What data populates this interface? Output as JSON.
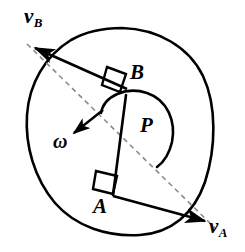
{
  "figure": {
    "type": "physics-diagram",
    "width": 245,
    "height": 252,
    "background_color": "#ffffff",
    "stroke_color": "#000000",
    "dashed_color": "#8a8a8a"
  },
  "labels": {
    "velocity_b": {
      "symbol": "v",
      "subscript": "B"
    },
    "velocity_a": {
      "symbol": "v",
      "subscript": "A"
    },
    "point_b": "B",
    "point_a": "A",
    "point_p": "P",
    "omega": "ω"
  },
  "geometry": {
    "body_outline": {
      "name": "rigid-body-outline",
      "path": "M 122,28 C 158,29 189,47 203,76 C 217,106 216,148 205,182 C 194,214 171,233 140,235 C 108,237 76,227 55,203 C 34,178 25,145 27,115 C 29,84 45,56 71,40 C 87,31 104,28 122,28 Z"
    },
    "segment_ab": {
      "name": "segment-AB",
      "from": [
        113,
        195
      ],
      "to": [
        126,
        95
      ]
    },
    "velocity_b_arrow": {
      "name": "velocity-b-arrow",
      "from": [
        126,
        95
      ],
      "via": [
        126,
        88
      ],
      "to": [
        33,
        47
      ],
      "note": "drawn from the right-angle corner at B toward upper-left"
    },
    "velocity_a_arrow": {
      "name": "velocity-a-arrow",
      "from": [
        113,
        195
      ],
      "to": [
        207,
        221
      ]
    },
    "dashed_line": {
      "name": "instant-center-line",
      "from": [
        27,
        44
      ],
      "to": [
        216,
        229
      ]
    },
    "right_angle_b": {
      "name": "right-angle-marker-B",
      "points": "107,67 126,74 120,92 102,85"
    },
    "right_angle_a": {
      "name": "right-angle-marker-A",
      "points": "96,171 117,176 113,194 93,189"
    },
    "rotation_arc": {
      "name": "rotation-arc",
      "path": "M 101,113 C 104,96 126,86 147,93 C 168,100 176,122 172,142 C 169,155 163,162 157,167"
    },
    "omega_arrow": {
      "name": "omega-arrow",
      "path": "M 101,113 L 74,133",
      "tip": [
        72,
        135
      ]
    }
  }
}
